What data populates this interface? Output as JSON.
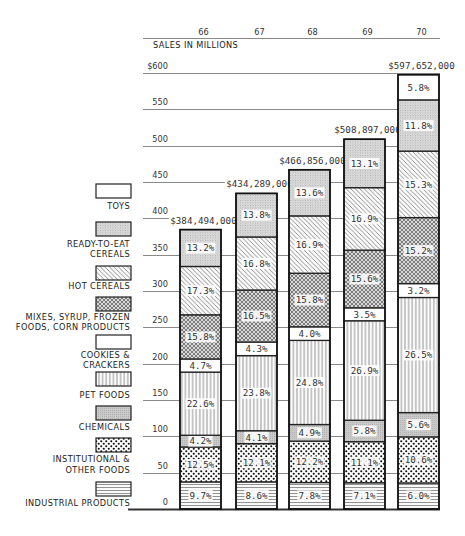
{
  "chart_data": {
    "type": "bar",
    "stacked": true,
    "title": "",
    "xlabel": "",
    "ylabel": "SALES IN MILLIONS",
    "categories": [
      "66",
      "67",
      "68",
      "69",
      "70"
    ],
    "totals_label": [
      "$384,494,000",
      "$434,289,000",
      "$466,856,000",
      "$508,897,000",
      "$597,652,000"
    ],
    "totals_millions": [
      384.494,
      434.289,
      466.856,
      508.897,
      597.652
    ],
    "ylim": [
      0,
      600
    ],
    "yticks": [
      {
        "value": 600,
        "label": "$600"
      },
      {
        "value": 550,
        "label": "550"
      },
      {
        "value": 500,
        "label": "500"
      },
      {
        "value": 450,
        "label": "450"
      },
      {
        "value": 400,
        "label": "400"
      },
      {
        "value": 350,
        "label": "350"
      },
      {
        "value": 300,
        "label": "300"
      },
      {
        "value": 250,
        "label": "250"
      },
      {
        "value": 200,
        "label": "200"
      },
      {
        "value": 150,
        "label": "150"
      },
      {
        "value": 100,
        "label": "100"
      },
      {
        "value": 50,
        "label": "50"
      },
      {
        "value": 0,
        "label": "0"
      }
    ],
    "grid": true,
    "legend_position": "left",
    "value_unit": "% of annual sales",
    "series": [
      {
        "name": "INDUSTRIAL PRODUCTS",
        "label_lines": [
          "INDUSTRIAL PRODUCTS"
        ],
        "pattern": "horizontal-lines",
        "values": [
          9.7,
          8.6,
          7.8,
          7.1,
          6.0
        ]
      },
      {
        "name": "INSTITUTIONAL & OTHER FOODS",
        "label_lines": [
          "INSTITUTIONAL &",
          "OTHER FOODS"
        ],
        "pattern": "large-dots",
        "values": [
          12.5,
          12.1,
          12.2,
          11.1,
          10.6
        ]
      },
      {
        "name": "CHEMICALS",
        "label_lines": [
          "CHEMICALS"
        ],
        "pattern": "gray-fill",
        "values": [
          4.2,
          4.1,
          4.9,
          5.8,
          5.6
        ]
      },
      {
        "name": "PET FOODS",
        "label_lines": [
          "PET FOODS"
        ],
        "pattern": "vertical-lines",
        "values": [
          22.6,
          23.8,
          24.8,
          26.9,
          26.5
        ]
      },
      {
        "name": "COOKIES & CRACKERS",
        "label_lines": [
          "COOKIES &",
          "CRACKERS"
        ],
        "pattern": "blank",
        "values": [
          4.7,
          4.3,
          4.0,
          3.5,
          3.2
        ]
      },
      {
        "name": "MIXES, SYRUP, FROZEN FOODS, CORN PRODUCTS",
        "label_lines": [
          "MIXES, SYRUP, FROZEN",
          "FOODS, CORN PRODUCTS"
        ],
        "pattern": "crosshatch",
        "values": [
          15.8,
          16.5,
          15.8,
          15.6,
          15.2
        ]
      },
      {
        "name": "HOT CEREALS",
        "label_lines": [
          "HOT CEREALS"
        ],
        "pattern": "diagonal-lines",
        "values": [
          17.3,
          16.8,
          16.9,
          16.9,
          15.3
        ]
      },
      {
        "name": "READY-TO-EAT CEREALS",
        "label_lines": [
          "READY-TO-EAT",
          "CEREALS"
        ],
        "pattern": "fine-stipple",
        "values": [
          13.2,
          13.8,
          13.6,
          13.1,
          11.8
        ]
      },
      {
        "name": "TOYS",
        "label_lines": [
          "TOYS"
        ],
        "pattern": "blank",
        "values": [
          null,
          null,
          null,
          null,
          5.8
        ]
      }
    ]
  }
}
